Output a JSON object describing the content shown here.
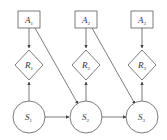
{
  "diagram": {
    "actions": [
      {
        "id": "A1",
        "name": "A",
        "sub": "1"
      },
      {
        "id": "A2",
        "name": "A",
        "sub": "2"
      },
      {
        "id": "A3",
        "name": "A",
        "sub": "3"
      }
    ],
    "rewards": [
      {
        "id": "R1",
        "name": "R",
        "sub": "1"
      },
      {
        "id": "R2",
        "name": "R",
        "sub": "2"
      },
      {
        "id": "R3",
        "name": "R",
        "sub": "3"
      }
    ],
    "states": [
      {
        "id": "S1",
        "name": "S",
        "sub": "1"
      },
      {
        "id": "S2",
        "name": "S",
        "sub": "2"
      },
      {
        "id": "S3",
        "name": "S",
        "sub": "3"
      }
    ],
    "edges": [
      [
        "A1",
        "R1"
      ],
      [
        "A1",
        "S2"
      ],
      [
        "S1",
        "R1"
      ],
      [
        "S1",
        "S2"
      ],
      [
        "A2",
        "R2"
      ],
      [
        "A2",
        "S3"
      ],
      [
        "S2",
        "R2"
      ],
      [
        "S2",
        "S3"
      ],
      [
        "A3",
        "R3"
      ],
      [
        "S3",
        "R3"
      ]
    ],
    "colors": {
      "stroke": "#444444",
      "background": "#ffffff"
    }
  }
}
